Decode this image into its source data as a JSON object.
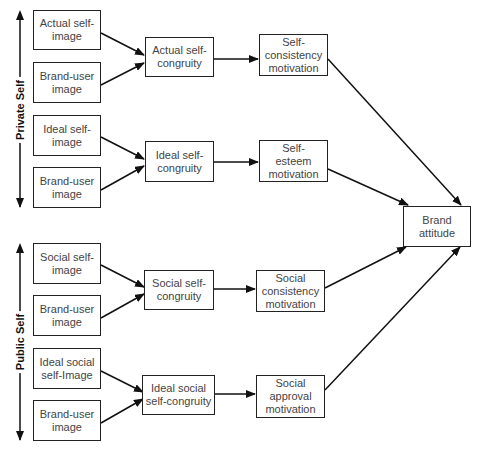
{
  "groups": {
    "private": "Private Self",
    "public": "Public Self"
  },
  "inputs": [
    "Actual self-\nimage",
    "Brand-user\nimage",
    "Ideal self-\nimage",
    "Brand-user\nimage",
    "Social self-\nimage",
    "Brand-user\nimage",
    "Ideal social\nself-Image",
    "Brand-user\nimage"
  ],
  "congruity": [
    "Actual self-\ncongruity",
    "Ideal self-\ncongruity",
    "Social self-\ncongruity",
    "Ideal social\nself-congruity"
  ],
  "motivation": [
    "Self-\nconsistency\nmotivation",
    "Self-\nesteem\nmotivation",
    "Social\nconsistency\nmotivation",
    "Social\napproval\nmotivation"
  ],
  "outcome": "Brand\nattitude"
}
